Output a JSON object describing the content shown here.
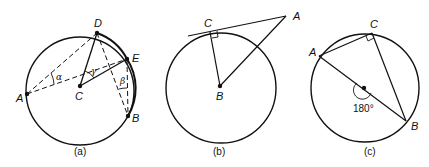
{
  "figure": {
    "panels": [
      {
        "id": "a",
        "caption": "(a)",
        "points": {
          "A": "A",
          "B": "B",
          "C": "C",
          "D": "D",
          "E": "E"
        },
        "angles": {
          "alpha": "α",
          "beta": "β",
          "gamma": "γ"
        }
      },
      {
        "id": "b",
        "caption": "(b)",
        "points": {
          "A": "A",
          "B": "B",
          "C": "C"
        }
      },
      {
        "id": "c",
        "caption": "(c)",
        "points": {
          "A": "A",
          "B": "B",
          "C": "C"
        },
        "angle_label": "180°"
      }
    ],
    "colors": {
      "stroke": "#111111",
      "background": "#ffffff"
    }
  }
}
